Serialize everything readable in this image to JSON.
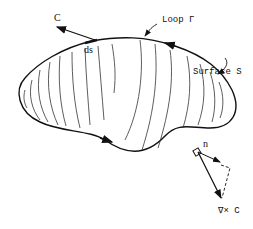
{
  "diagram": {
    "labels": {
      "vector_c": "C",
      "ds": "ds",
      "loop": "Loop Γ",
      "surface": "Surface S",
      "normal": "n",
      "curl": "∇× C"
    },
    "colors": {
      "stroke": "#111111",
      "background": "#ffffff"
    }
  }
}
